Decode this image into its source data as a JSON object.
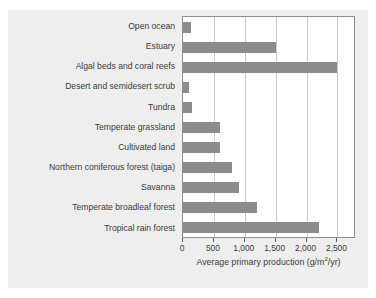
{
  "figure": {
    "caption_sliver": "",
    "background_color": "#eeeeee",
    "bar_color": "#8c8c8c",
    "grid_color": "#c9c9c9",
    "axis_color": "#8f8f8f",
    "text_color": "#3b3b3b"
  },
  "chart_data": {
    "type": "bar",
    "orientation": "horizontal",
    "title": "",
    "xlabel_parts": {
      "before": "Average primary production (g/m",
      "superscript": "2",
      "after": "/yr)"
    },
    "xlabel": "Average primary production (g/m2/yr)",
    "ylabel": "",
    "categories": [
      "Open ocean",
      "Estuary",
      "Algal beds and coral reefs",
      "Desert and semidesert scrub",
      "Tundra",
      "Temperate grassland",
      "Cultivated land",
      "Northern coniferous forest (taiga)",
      "Savanna",
      "Temperate broadleaf forest",
      "Tropical rain forest"
    ],
    "values": [
      125,
      1500,
      2500,
      90,
      140,
      600,
      600,
      800,
      900,
      1200,
      2200
    ],
    "xlim": [
      0,
      2800
    ],
    "xticks": [
      0,
      500,
      1000,
      1500,
      2000,
      2500
    ],
    "xtick_labels": [
      "0",
      "500",
      "1,000",
      "1,500",
      "2,000",
      "2,500"
    ],
    "grid": true,
    "grid_axis": "x",
    "legend": null
  }
}
